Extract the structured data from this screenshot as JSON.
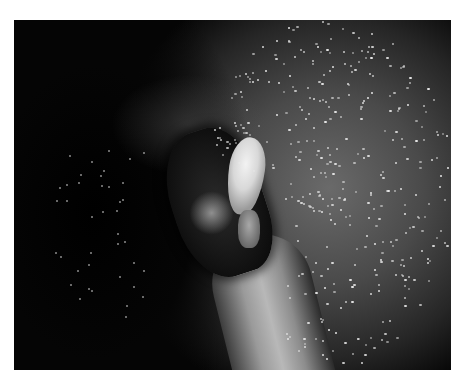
{
  "image": {
    "description": "Grayscale endoscopic view showing a white polypoid lesion atop a dark ulcerated mass, with a tubular structure extending downward and speckled reflective mucosa on the right",
    "frame": {
      "left": 14,
      "top": 20,
      "width": 437,
      "height": 350
    },
    "background_color": "#ffffff",
    "frame_color": "#050505"
  }
}
